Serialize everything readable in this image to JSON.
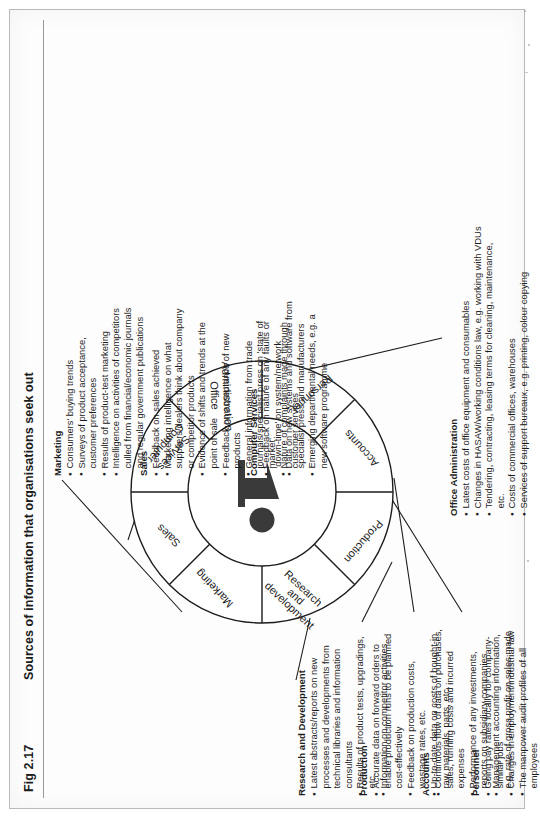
{
  "figure": {
    "label": "Fig 2.17",
    "title": "Sources of information that organisations seek out"
  },
  "wheel": {
    "center_icon": "person-pointing-icon",
    "segments": [
      {
        "id": "sales",
        "label": "Sales"
      },
      {
        "id": "computer",
        "label": "Computer\nServices",
        "line1": "Computer",
        "line2": "Services"
      },
      {
        "id": "officeadmin",
        "label": "Office\nAdministration",
        "line1": "Office",
        "line2": "Administration"
      },
      {
        "id": "personnel",
        "label": "Personnel"
      },
      {
        "id": "accounts",
        "label": "Accounts"
      },
      {
        "id": "production",
        "label": "Production"
      },
      {
        "id": "rnd",
        "label": "Research and development",
        "line1": "Research",
        "line2": "and",
        "line3": "development"
      },
      {
        "id": "marketing",
        "label": "Marketing"
      }
    ]
  },
  "blocks": {
    "marketing": {
      "heading": "Marketing",
      "items": [
        "Consumers' buying trends",
        "Surveys of product acceptance, customer preferences",
        "Results of product-test marketing",
        "Intelligence on activities of competitors culled from financial/economic journals and regular government publications"
      ]
    },
    "sales": {
      "heading": "Sales",
      "items": [
        "Feedback on sales achieved",
        "Marketing intelligence on what suppliers/dealers think about company or competitor products",
        "Evidence of shifts and trends at the point of sale",
        "Feedback on acceptance of new products",
        "General information from trade journals/specialist press on 'state of market'",
        "Nature of complaints made through customer services"
      ]
    },
    "computer_services": {
      "heading": "Computer Services",
      "items": [
        "Feedback on nature of any faults or 'down-time' on system/network",
        "Data on new systems and software from specialist press and manufacturers",
        "Emerging departmental needs, e.g. a new software programme"
      ]
    },
    "research_and_development": {
      "heading": "Research and Development",
      "items": [
        "Latest abstracts/reports on new processes and developments from technical libraries and information consultants",
        "Results of product tests, upgradings, etc.",
        "Information on competitor activities"
      ]
    },
    "production": {
      "heading": "Production",
      "items": [
        "Accurate data on forward orders to enable production runs to be planned cost-effectively",
        "Feedback on production costs, wastage rates, etc.",
        "Up-to-date data on costs of bought-in raw materials, parts, etc."
      ]
    },
    "accounts": {
      "heading": "Accounts",
      "items": [
        "Continuous flow of data on purchases, sales, running costs and incurred expenses",
        "Performance of any investments, reports on subsidiary companies",
        "Management accounting information, e.g. rate of gross profit on sales made"
      ]
    },
    "personnel": {
      "heading": "Personnel",
      "items": [
        "Going pay rates locally for company-similar jobs",
        "Changes in employment/industrial law",
        "The manpower audit profiles of all employees"
      ]
    },
    "office_administration": {
      "heading": "Office Administration",
      "items": [
        "Latest costs of office equipment and consumables",
        "Changes in HASAW/working conditions law, e.g. working with VDUs",
        "Tendering, contracting, leasing terms for cleaning, maintenance, etc.",
        "Costs of commercial offices, warehouses",
        "Services of support bureaux, e.g. printing, colour copying"
      ]
    }
  },
  "colors": {
    "ink": "#1c1c1c",
    "page": "#fdfdfd",
    "rule": "#9a9a9a",
    "icon": "#3a3a3a"
  }
}
